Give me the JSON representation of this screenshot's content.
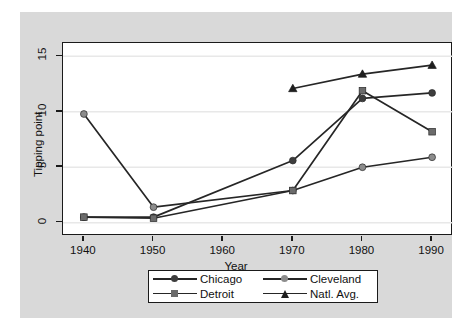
{
  "chart_data": {
    "type": "line",
    "title": "",
    "xlabel": "Year",
    "ylabel": "Tipping point",
    "x": [
      1940,
      1950,
      1960,
      1970,
      1980,
      1990
    ],
    "xticks": [
      "1940",
      "1950",
      "1960",
      "1970",
      "1980",
      "1990"
    ],
    "yticks": [
      "0",
      "5",
      "10",
      "15"
    ],
    "ytick_values": [
      0,
      5,
      10,
      15
    ],
    "xlim": [
      1937,
      1993
    ],
    "ylim": [
      -1.2,
      16.2
    ],
    "grid": "horizontal",
    "legend_position": "below-axes",
    "series": [
      {
        "name": "Chicago",
        "marker": "circle",
        "color": "#3d3d3d",
        "x": [
          1940,
          1950,
          1970,
          1980,
          1990
        ],
        "values": [
          0.5,
          0.5,
          5.6,
          11.2,
          11.7
        ]
      },
      {
        "name": "Cleveland",
        "marker": "circle",
        "color": "#8c8c8c",
        "x": [
          1940,
          1950,
          1970,
          1980,
          1990
        ],
        "values": [
          9.8,
          1.4,
          2.9,
          5.0,
          5.9
        ]
      },
      {
        "name": "Detroit",
        "marker": "square",
        "color": "#6b6b6b",
        "x": [
          1940,
          1950,
          1970,
          1980,
          1990
        ],
        "values": [
          0.5,
          0.4,
          2.9,
          11.9,
          8.2
        ]
      },
      {
        "name": "Natl. Avg.",
        "marker": "triangle",
        "color": "#1f1f1f",
        "x": [
          1970,
          1980,
          1990
        ],
        "values": [
          12.1,
          13.4,
          14.2
        ]
      }
    ]
  },
  "colors": {
    "figure_background": "#d9d9d9",
    "panel_background": "#ffffff",
    "axis": "#1a1a1a",
    "gridline": "#e8e8e8",
    "line": "#262626",
    "text": "#111111"
  },
  "legend": {
    "items": [
      {
        "label": "Chicago",
        "marker": "circle",
        "color": "#3d3d3d"
      },
      {
        "label": "Cleveland",
        "marker": "circle",
        "color": "#8c8c8c"
      },
      {
        "label": "Detroit",
        "marker": "square",
        "color": "#6b6b6b"
      },
      {
        "label": "Natl. Avg.",
        "marker": "triangle",
        "color": "#1f1f1f"
      }
    ]
  }
}
